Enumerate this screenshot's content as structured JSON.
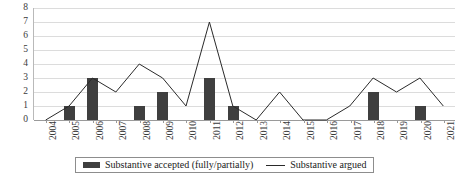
{
  "chart_data": {
    "type": "bar",
    "title": "",
    "xlabel": "",
    "ylabel": "",
    "ylim": [
      0,
      8
    ],
    "ytick_step": 1,
    "yticks": [
      8,
      7,
      6,
      5,
      4,
      3,
      2,
      1,
      0
    ],
    "grid": true,
    "legend_position": "bottom",
    "categories": [
      "2004",
      "2005",
      "2006",
      "2007",
      "2008",
      "2009",
      "2010",
      "2011",
      "2012",
      "2013",
      "2014",
      "2015",
      "2016",
      "2017",
      "2018",
      "2019",
      "2020",
      "2021"
    ],
    "series": [
      {
        "name": "Substantive accepted (fully/partially)",
        "type": "bar",
        "color": "#3f3f3f",
        "values": [
          0,
          1,
          3,
          0,
          1,
          2,
          0,
          3,
          1,
          0,
          0,
          0,
          0,
          0,
          2,
          0,
          1,
          0
        ]
      },
      {
        "name": "Substantive argued",
        "type": "line",
        "color": "#2a2a2a",
        "values": [
          0,
          1,
          3,
          2,
          4,
          3,
          1,
          7,
          1,
          0,
          2,
          0,
          0,
          1,
          3,
          2,
          3,
          1
        ]
      }
    ]
  },
  "legend": {
    "items": [
      {
        "label": "Substantive accepted (fully/partially)",
        "marker": "bar-swatch"
      },
      {
        "label": "Substantive argued",
        "marker": "line-swatch"
      }
    ]
  }
}
